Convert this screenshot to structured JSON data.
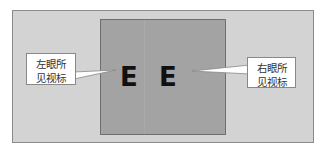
{
  "diagram": {
    "left_callout": {
      "line1": "左眼所",
      "line2": "见视标"
    },
    "right_callout": {
      "line1": "右眼所",
      "line2": "见视标"
    },
    "left_optotype": "E",
    "right_optotype": "E",
    "colors": {
      "background_field": "#d3d3d3",
      "center_square": "#a3a3a3",
      "optotype": "#111111",
      "callout_fill": "#ffffff"
    }
  }
}
